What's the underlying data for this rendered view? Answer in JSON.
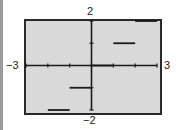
{
  "chart_data": {
    "type": "line",
    "title": "",
    "xlabel": "",
    "ylabel": "",
    "xlim": [
      -3,
      3
    ],
    "ylim": [
      -2,
      2
    ],
    "x_tick_labels": [
      "-3",
      "3"
    ],
    "y_tick_labels": [
      "2",
      "-2"
    ],
    "x_ticks": [
      -2,
      -1,
      0,
      1,
      2
    ],
    "y_ticks": [
      -1,
      0,
      1
    ],
    "grid": false,
    "style": "graphing-calculator step function",
    "series": [
      {
        "name": "step function",
        "segments": [
          {
            "x": [
              -2,
              -1
            ],
            "y": -2
          },
          {
            "x": [
              -1,
              0
            ],
            "y": -1
          },
          {
            "x": [
              0,
              1
            ],
            "y": 0
          },
          {
            "x": [
              1,
              2
            ],
            "y": 1
          },
          {
            "x": [
              2,
              3
            ],
            "y": 2
          }
        ]
      }
    ],
    "colors": {
      "background": "#d9d9d9",
      "line": "#1a1a1a",
      "frame": "#2a2a2a"
    }
  },
  "labels": {
    "x_min": "−3",
    "x_max": "3",
    "y_max": "2",
    "y_min": "−2"
  }
}
